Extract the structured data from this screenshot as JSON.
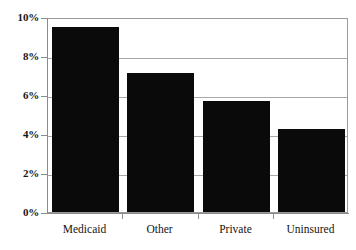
{
  "chart_data": {
    "type": "bar",
    "title": "",
    "subtitle": "",
    "xlabel": "",
    "ylabel": "",
    "categories": [
      "Medicaid",
      "Other",
      "Private",
      "Uninsured"
    ],
    "values": [
      9.5,
      7.15,
      5.7,
      4.25
    ],
    "value_labels": [
      "9.5%",
      "7.15%",
      "5.7%",
      "4.25%"
    ],
    "ylim": [
      0,
      10
    ],
    "ytick_values": [
      0,
      2,
      4,
      6,
      8,
      10
    ],
    "ytick_labels": [
      "0%",
      "2%",
      "4%",
      "6%",
      "8%",
      "10%"
    ],
    "grid": true,
    "grid_axis": "y",
    "legend": false,
    "legend_position": "none",
    "series": [
      {
        "name": "",
        "values": [
          9.5,
          7.15,
          5.7,
          4.25
        ],
        "color": "#0a0a0a"
      }
    ],
    "annotations": []
  },
  "style": {
    "bar_color": "#0a0a0a",
    "grid_color": "#a8a8a8",
    "axis_color": "#8c8c8c",
    "background": "#ffffff",
    "text_color": "#141414"
  }
}
